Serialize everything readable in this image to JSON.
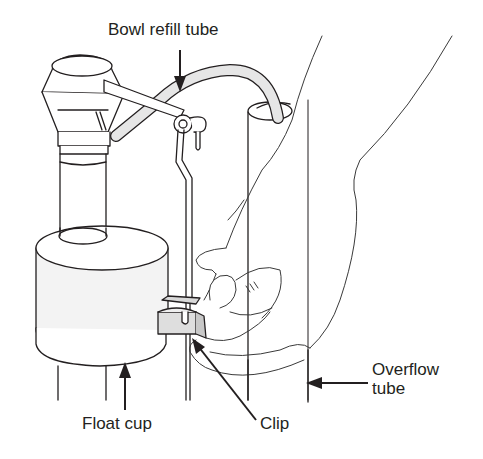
{
  "diagram": {
    "colors": {
      "line": "#231f20",
      "fill_light": "#ececec",
      "fill_mid": "#d4d4d4",
      "background": "#ffffff"
    },
    "labels": [
      {
        "id": "bowl-refill-tube",
        "text": "Bowl refill tube",
        "x": 108,
        "y": 20
      },
      {
        "id": "overflow-tube",
        "text_line1": "Overflow",
        "text_line2": "tube",
        "x": 372,
        "y": 360
      },
      {
        "id": "float-cup",
        "text": "Float cup",
        "x": 82,
        "y": 414
      },
      {
        "id": "clip",
        "text": "Clip",
        "x": 260,
        "y": 414
      }
    ]
  }
}
